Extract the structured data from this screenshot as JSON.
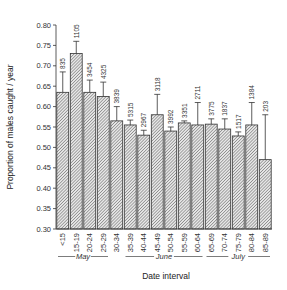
{
  "chart_data": {
    "type": "bar",
    "title": "",
    "xlabel": "Date interval",
    "ylabel": "Proportion of males caught / year",
    "ylim": [
      0.3,
      0.8
    ],
    "yticks": [
      "0.30",
      "0.35",
      "0.40",
      "0.45",
      "0.50",
      "0.55",
      "0.60",
      "0.65",
      "0.70",
      "0.75",
      "0.80"
    ],
    "grid": false,
    "legend": null,
    "categories": [
      "<15",
      "15-19",
      "20-24",
      "25-29",
      "30-34",
      "35-39",
      "40-44",
      "45-49",
      "50-54",
      "55-59",
      "60-64",
      "65-69",
      "70-74",
      "75-79",
      "80-84",
      "85-89"
    ],
    "values": [
      0.635,
      0.73,
      0.635,
      0.625,
      0.565,
      0.555,
      0.53,
      0.58,
      0.54,
      0.56,
      0.555,
      0.557,
      0.545,
      0.528,
      0.555,
      0.47
    ],
    "error_upper": [
      0.685,
      0.76,
      0.665,
      0.66,
      0.6,
      0.567,
      0.542,
      0.63,
      0.55,
      0.565,
      0.61,
      0.57,
      0.57,
      0.538,
      0.61,
      0.58
    ],
    "sample_sizes": [
      "835",
      "1105",
      "3454",
      "4325",
      "3839",
      "5315",
      "2967",
      "3118",
      "3992",
      "3351",
      "2711",
      "3775",
      "1837",
      "1517",
      "1384",
      "203"
    ],
    "month_groups": [
      {
        "label": "May",
        "from": 0,
        "to": 3
      },
      {
        "label": "June",
        "from": 5,
        "to": 10
      },
      {
        "label": "July",
        "from": 11,
        "to": 15
      }
    ]
  }
}
